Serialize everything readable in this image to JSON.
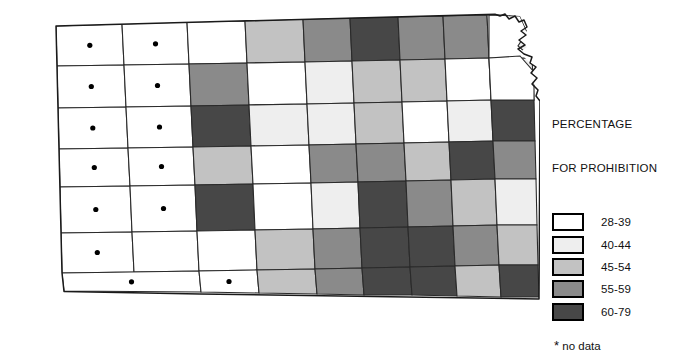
{
  "figure": {
    "kind": "choropleth-map"
  },
  "legend": {
    "title_line1": "PERCENTAGE",
    "title_line2": "FOR PROHIBITION",
    "classes": [
      {
        "label": "28-39",
        "color": "#ffffff"
      },
      {
        "label": "40-44",
        "color": "#eeeeee"
      },
      {
        "label": "45-54",
        "color": "#c2c2c2"
      },
      {
        "label": "55-59",
        "color": "#8a8a8a"
      },
      {
        "label": "60-79",
        "color": "#474747"
      }
    ],
    "note": "no data",
    "note_marker": "*"
  },
  "chart_data": {
    "type": "map",
    "title": "PERCENTAGE FOR PROHIBITION",
    "classification": "graduated gray scale, 5 classes plus no-data",
    "bins": [
      "28-39",
      "40-44",
      "45-54",
      "55-59",
      "60-79"
    ],
    "bin_colors": [
      "#ffffff",
      "#eeeeee",
      "#c2c2c2",
      "#8a8a8a",
      "#474747"
    ],
    "no_data_marker": "*",
    "legend_position": "right",
    "grid": false,
    "regions": [
      {
        "id": "r1c1",
        "bin": null,
        "nodata": true,
        "pts": "56,26 122,24 124,65 57,66"
      },
      {
        "id": "r1c2",
        "bin": null,
        "nodata": true,
        "pts": "122,24 187,22 189,64 124,65"
      },
      {
        "id": "r1c3",
        "bin": 0,
        "pts": "187,22 245,21 247,63 189,64"
      },
      {
        "id": "r1c4",
        "bin": 2,
        "pts": "245,21 303,19 305,62 247,63"
      },
      {
        "id": "r1c5",
        "bin": 3,
        "pts": "303,19 350,18 352,61 305,62"
      },
      {
        "id": "r1c6",
        "bin": 4,
        "pts": "350,18 398,17 400,60 352,61"
      },
      {
        "id": "r1c7",
        "bin": 3,
        "pts": "398,17 443,16 445,59 400,60"
      },
      {
        "id": "r1c8",
        "bin": 3,
        "pts": "443,16 487,15 489,58 445,59"
      },
      {
        "id": "r1c9",
        "bin": 1,
        "pts": "487,15 530,14 532,58 489,58"
      },
      {
        "id": "r2c1",
        "bin": null,
        "nodata": true,
        "pts": "57,66 124,65 126,107 58,108"
      },
      {
        "id": "r2c2",
        "bin": null,
        "nodata": true,
        "pts": "124,65 189,64 191,106 126,107"
      },
      {
        "id": "r2c3",
        "bin": 3,
        "pts": "189,64 247,63 249,105 191,106"
      },
      {
        "id": "r2c4",
        "bin": 0,
        "pts": "247,63 305,62 307,104 249,105"
      },
      {
        "id": "r2c5",
        "bin": 1,
        "pts": "305,62 352,61 354,103 307,104"
      },
      {
        "id": "r2c6",
        "bin": 2,
        "pts": "352,61 400,60 402,102 354,103"
      },
      {
        "id": "r2c7",
        "bin": 2,
        "pts": "400,60 445,59 447,101 402,102"
      },
      {
        "id": "r2c8",
        "bin": 0,
        "pts": "445,59 489,58 491,100 447,101"
      },
      {
        "id": "r2c9",
        "bin": 1,
        "pts": "489,58 532,58 534,100 491,100"
      },
      {
        "id": "r3c1",
        "bin": null,
        "nodata": true,
        "pts": "58,108 126,107 128,148 59,149"
      },
      {
        "id": "r3c2",
        "bin": null,
        "nodata": true,
        "pts": "126,107 191,106 193,147 128,148"
      },
      {
        "id": "r3c3",
        "bin": 4,
        "pts": "191,106 249,105 251,146 193,147"
      },
      {
        "id": "r3c4",
        "bin": 1,
        "pts": "249,105 307,104 309,145 251,146"
      },
      {
        "id": "r3c5",
        "bin": 1,
        "pts": "307,104 354,103 356,144 309,145"
      },
      {
        "id": "r3c6",
        "bin": 2,
        "pts": "354,103 402,102 404,143 356,144"
      },
      {
        "id": "r3c7",
        "bin": 0,
        "pts": "402,102 447,101 449,142 404,143"
      },
      {
        "id": "r3c8",
        "bin": 1,
        "pts": "447,101 491,100 493,141 449,142"
      },
      {
        "id": "r3c9",
        "bin": 4,
        "pts": "491,100 534,100 535,141 493,141"
      },
      {
        "id": "r4c1",
        "bin": null,
        "nodata": true,
        "pts": "59,149 128,148 130,186 60,187"
      },
      {
        "id": "r4c2",
        "bin": null,
        "nodata": true,
        "pts": "128,148 193,147 195,185 130,186"
      },
      {
        "id": "r4c3",
        "bin": 2,
        "pts": "193,147 251,146 253,184 195,185"
      },
      {
        "id": "r4c4",
        "bin": 0,
        "pts": "251,146 309,145 311,183 253,184"
      },
      {
        "id": "r4c5",
        "bin": 3,
        "pts": "309,145 356,144 358,182 311,183"
      },
      {
        "id": "r4c6",
        "bin": 3,
        "pts": "356,144 404,143 406,181 358,182"
      },
      {
        "id": "r4c7",
        "bin": 2,
        "pts": "404,143 449,142 451,180 406,181"
      },
      {
        "id": "r4c8",
        "bin": 4,
        "pts": "449,142 493,141 495,179 451,180"
      },
      {
        "id": "r4c9",
        "bin": 3,
        "pts": "493,141 535,141 536,179 495,179"
      },
      {
        "id": "r5c1",
        "bin": null,
        "nodata": true,
        "pts": "60,187 130,186 132,232 61,233"
      },
      {
        "id": "r5c2",
        "bin": null,
        "nodata": true,
        "pts": "130,186 195,185 197,231 132,232"
      },
      {
        "id": "r5c3",
        "bin": 4,
        "pts": "195,185 253,184 255,230 197,231"
      },
      {
        "id": "r5c4",
        "bin": 0,
        "pts": "253,184 311,183 313,229 255,230"
      },
      {
        "id": "r5c5",
        "bin": 1,
        "pts": "311,183 358,182 360,228 313,229"
      },
      {
        "id": "r5c6",
        "bin": 4,
        "pts": "358,182 406,181 408,227 360,228"
      },
      {
        "id": "r5c7",
        "bin": 3,
        "pts": "406,181 451,180 453,226 408,227"
      },
      {
        "id": "r5c8",
        "bin": 2,
        "pts": "451,180 495,179 497,225 453,226"
      },
      {
        "id": "r5c9",
        "bin": 1,
        "pts": "495,179 536,179 537,225 497,225"
      },
      {
        "id": "r6c1",
        "bin": null,
        "nodata": true,
        "pts": "61,233 132,232 134,272 62,273"
      },
      {
        "id": "r6c2",
        "bin": 0,
        "pts": "132,232 197,231 199,271 134,272"
      },
      {
        "id": "r6c3",
        "bin": 0,
        "pts": "197,231 255,230 257,270 199,271"
      },
      {
        "id": "r6c4",
        "bin": 2,
        "pts": "255,230 313,229 315,269 257,270"
      },
      {
        "id": "r6c5",
        "bin": 3,
        "pts": "313,229 360,228 362,268 315,269"
      },
      {
        "id": "r6c6",
        "bin": 4,
        "pts": "360,228 408,227 410,267 362,268"
      },
      {
        "id": "r6c7",
        "bin": 4,
        "pts": "408,227 453,226 455,266 410,267"
      },
      {
        "id": "r6c8",
        "bin": 3,
        "pts": "453,226 497,225 499,265 455,266"
      },
      {
        "id": "r6c9",
        "bin": 2,
        "pts": "497,225 537,225 538,265 499,265"
      },
      {
        "id": "r7c1",
        "bin": null,
        "nodata": true,
        "pts": "62,273 199,271 201,292 64,291"
      },
      {
        "id": "r7c2",
        "bin": null,
        "nodata": true,
        "pts": "199,271 257,270 259,293 201,292"
      },
      {
        "id": "r7c3",
        "bin": 2,
        "pts": "257,270 315,269 317,294 259,293"
      },
      {
        "id": "r7c4",
        "bin": 3,
        "pts": "315,269 362,268 364,295 317,294"
      },
      {
        "id": "r7c5",
        "bin": 4,
        "pts": "362,268 410,267 412,295 364,295"
      },
      {
        "id": "r7c6",
        "bin": 4,
        "pts": "410,267 455,266 457,296 412,295"
      },
      {
        "id": "r7c7",
        "bin": 2,
        "pts": "455,266 499,265 501,297 457,296"
      },
      {
        "id": "r7c8",
        "bin": 4,
        "pts": "499,265 538,265 539,297 501,297"
      },
      {
        "id": "ne1",
        "bin": 0,
        "pts": "489,15 520,16 527,32 518,46 532,58 489,58"
      },
      {
        "id": "ne2",
        "bin": 0,
        "pts": "489,58 520,56 534,72 534,100 491,100"
      }
    ]
  }
}
